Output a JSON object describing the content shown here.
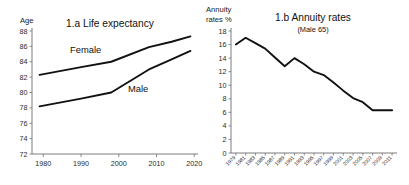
{
  "figure": {
    "background_color": "#ffffff",
    "line_color": "#111111",
    "axis_color": "#6e6e6e",
    "text_color": "#111111"
  },
  "chart_data": [
    {
      "id": "life-expectancy",
      "type": "line",
      "title": "1.a Life expectancy",
      "subtitle": "",
      "ylabel": "Age",
      "xlabel": "",
      "ylim": [
        72,
        88
      ],
      "xlim": [
        1977,
        2021
      ],
      "yticks": [
        72,
        74,
        76,
        78,
        80,
        82,
        84,
        86,
        88
      ],
      "ytick_labels": [
        "72",
        "74",
        "76",
        "78",
        "80",
        "82",
        "84",
        "86",
        "88"
      ],
      "xticks": [
        1980,
        1990,
        2000,
        2010,
        2020
      ],
      "xtick_labels": [
        "1980",
        "1990",
        "2000",
        "2010",
        "2020"
      ],
      "grid": false,
      "legend_position": "inline-annotation",
      "series": [
        {
          "name": "Female",
          "label_text": "Female",
          "x": [
            1979,
            1990,
            1998,
            2008,
            2014,
            2019
          ],
          "values": [
            82.3,
            83.3,
            84.0,
            85.9,
            86.6,
            87.3
          ]
        },
        {
          "name": "Male",
          "label_text": "Male",
          "x": [
            1979,
            1990,
            1998,
            2008,
            2014,
            2019
          ],
          "values": [
            78.2,
            79.2,
            80.0,
            83.0,
            84.3,
            85.4
          ]
        }
      ]
    },
    {
      "id": "annuity-rates",
      "type": "line",
      "title": "1.b Annuity rates",
      "subtitle": "(Male 65)",
      "ylabel": "Annuity rates %",
      "ylabel_line1": "Annuity",
      "ylabel_line2": "rates %",
      "xlabel": "",
      "ylim": [
        0,
        18
      ],
      "yticks": [
        0,
        2,
        4,
        6,
        8,
        10,
        12,
        14,
        16,
        18
      ],
      "ytick_labels": [
        "0",
        "2",
        "4",
        "6",
        "8",
        "10",
        "12",
        "14",
        "16",
        "18"
      ],
      "categories": [
        "1979",
        "1981",
        "1983",
        "1985",
        "1987",
        "1989",
        "1991",
        "1993",
        "1995",
        "1997",
        "1999",
        "2001",
        "2003",
        "2005",
        "2007",
        "2009",
        "2011"
      ],
      "grid": false,
      "legend_position": "none",
      "series": [
        {
          "name": "Annuity rate (Male 65)",
          "values": [
            16.0,
            17.0,
            16.2,
            15.4,
            14.1,
            12.8,
            14.0,
            13.1,
            12.0,
            11.5,
            10.4,
            9.2,
            8.1,
            7.5,
            6.3,
            6.3,
            6.3
          ]
        }
      ]
    }
  ]
}
